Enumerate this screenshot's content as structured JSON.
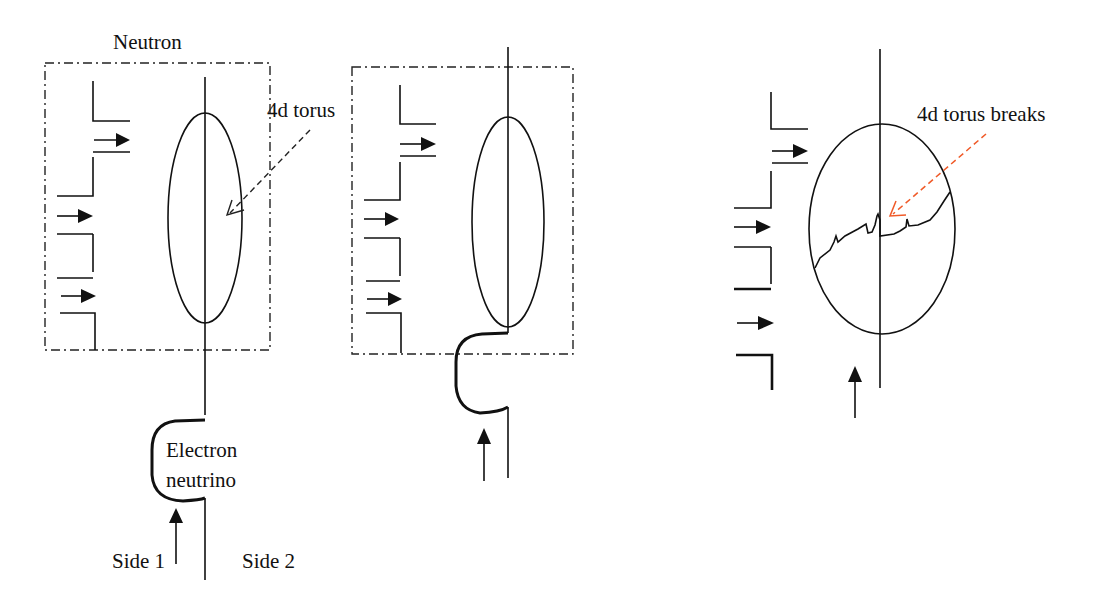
{
  "diagram": {
    "type": "physics-schematic",
    "panels": [
      {
        "id": "panel-1",
        "labels": {
          "box_title": "Neutron",
          "torus": "4d torus",
          "particle_line1": "Electron",
          "particle_line2": "neutrino",
          "side_left": "Side 1",
          "side_right": "Side 2"
        }
      },
      {
        "id": "panel-2",
        "labels": {}
      },
      {
        "id": "panel-3",
        "labels": {
          "torus": "4d torus breaks"
        }
      }
    ],
    "colors": {
      "line": "#111111",
      "pointer_arrow_panel1": "#222222",
      "pointer_arrow_panel3": "#f05a28"
    }
  }
}
